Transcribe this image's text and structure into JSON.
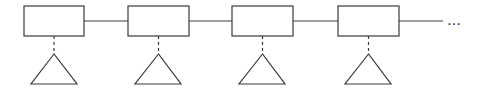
{
  "diagram": {
    "type": "linked-chain",
    "stroke_color": "#3a3a3a",
    "background": "#ffffff",
    "nodes": [
      {
        "id": "node-1",
        "box": {
          "x": 24,
          "y": 6,
          "w": 60,
          "h": 30
        },
        "triangle": {
          "apex": [
            54,
            54
          ],
          "base_left": [
            31,
            84
          ],
          "base_right": [
            77,
            84
          ]
        }
      },
      {
        "id": "node-2",
        "box": {
          "x": 128,
          "y": 6,
          "w": 61,
          "h": 30
        },
        "triangle": {
          "apex": [
            158,
            54
          ],
          "base_left": [
            135,
            84
          ],
          "base_right": [
            181,
            84
          ]
        }
      },
      {
        "id": "node-3",
        "box": {
          "x": 232,
          "y": 6,
          "w": 61,
          "h": 30
        },
        "triangle": {
          "apex": [
            262,
            54
          ],
          "base_left": [
            239,
            84
          ],
          "base_right": [
            285,
            84
          ]
        }
      },
      {
        "id": "node-4",
        "box": {
          "x": 338,
          "y": 6,
          "w": 61,
          "h": 30
        },
        "triangle": {
          "apex": [
            368,
            54
          ],
          "base_left": [
            345,
            84
          ],
          "base_right": [
            391,
            84
          ]
        }
      }
    ],
    "links": [
      {
        "x1": 84,
        "x2": 128,
        "y": 21
      },
      {
        "x1": 189,
        "x2": 232,
        "y": 21
      },
      {
        "x1": 293,
        "x2": 338,
        "y": 21
      },
      {
        "x1": 399,
        "x2": 443,
        "y": 21
      }
    ],
    "continuation": "…"
  }
}
